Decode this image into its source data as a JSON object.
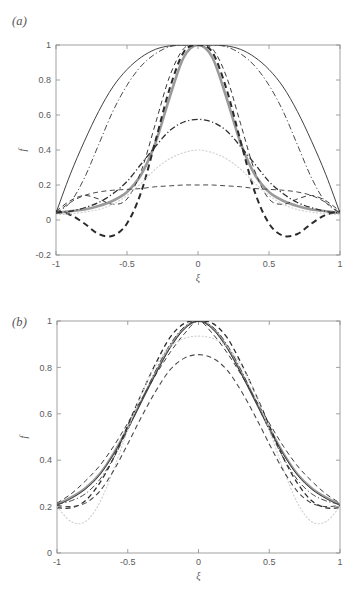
{
  "figure": {
    "panels": [
      {
        "id": "a",
        "label": "(a)",
        "xlabel": "ξ",
        "ylabel": "f",
        "xticks": [
          "-1",
          "-0.5",
          "0",
          "0.5",
          "1"
        ],
        "xtickvals": [
          -1,
          -0.5,
          0,
          0.5,
          1
        ],
        "yticks": [
          "-0.2",
          "0",
          "0.2",
          "0.4",
          "0.6",
          "0.8",
          "1"
        ],
        "ytickvals": [
          -0.2,
          0,
          0.2,
          0.4,
          0.6,
          0.8,
          1
        ],
        "xlim": [
          -1,
          1
        ],
        "ylim": [
          -0.2,
          1
        ]
      },
      {
        "id": "b",
        "label": "(b)",
        "xlabel": "ξ",
        "ylabel": "f",
        "xticks": [
          "-1",
          "-0.5",
          "0",
          "0.5",
          "1"
        ],
        "xtickvals": [
          -1,
          -0.5,
          0,
          0.5,
          1
        ],
        "yticks": [
          "0",
          "0.2",
          "0.4",
          "0.6",
          "0.8",
          "1"
        ],
        "ytickvals": [
          0,
          0.2,
          0.4,
          0.6,
          0.8,
          1
        ],
        "xlim": [
          -1,
          1
        ],
        "ylim": [
          0,
          1
        ]
      }
    ]
  },
  "colors": {
    "axis": "#8a8a8a",
    "tick_text": "#5a5a5a",
    "black": "#2b2b2b",
    "dark": "#3a3a3a",
    "gray_thick": "#9a9a9a",
    "light_dotted": "#cfcfcf",
    "mid_gray": "#6f6f6f",
    "background": "#ffffff"
  },
  "chart_data": [
    {
      "type": "line",
      "panel": "a",
      "title": "",
      "xlabel": "ξ",
      "ylabel": "f",
      "xlim": [
        -1,
        1
      ],
      "ylim": [
        -0.2,
        1
      ],
      "grid": false,
      "legend": "none",
      "x": [
        -1,
        -0.9,
        -0.8,
        -0.7,
        -0.6,
        -0.5,
        -0.4,
        -0.3,
        -0.2,
        -0.1,
        0,
        0.1,
        0.2,
        0.3,
        0.4,
        0.5,
        0.6,
        0.7,
        0.8,
        0.9,
        1
      ],
      "series": [
        {
          "name": "thin-solid-parabola",
          "style": "solid",
          "width": 0.9,
          "color": "#2b2b2b",
          "values": [
            0.04,
            0.26,
            0.45,
            0.62,
            0.76,
            0.86,
            0.93,
            0.975,
            0.995,
            1.0,
            1.0,
            1.0,
            0.995,
            0.975,
            0.93,
            0.86,
            0.76,
            0.62,
            0.45,
            0.26,
            0.04
          ]
        },
        {
          "name": "thick-gray-solid",
          "style": "solid",
          "width": 2.6,
          "color": "#9a9a9a",
          "values": [
            0.04,
            0.05,
            0.06,
            0.08,
            0.11,
            0.16,
            0.26,
            0.44,
            0.7,
            0.93,
            1.0,
            0.93,
            0.7,
            0.44,
            0.26,
            0.16,
            0.11,
            0.08,
            0.06,
            0.05,
            0.04
          ]
        },
        {
          "name": "heavy-black-dashed",
          "style": "dashed",
          "width": 2.0,
          "color": "#2b2b2b",
          "values": [
            0.05,
            0.03,
            -0.02,
            -0.08,
            -0.09,
            -0.02,
            0.16,
            0.45,
            0.75,
            0.96,
            1.0,
            0.96,
            0.75,
            0.45,
            0.16,
            -0.02,
            -0.09,
            -0.08,
            -0.02,
            0.03,
            0.05
          ]
        },
        {
          "name": "dash-dot-wide",
          "style": "dashdot",
          "width": 1.0,
          "color": "#4a4a4a",
          "values": [
            0.04,
            0.1,
            0.24,
            0.43,
            0.62,
            0.77,
            0.88,
            0.95,
            0.99,
            1.0,
            1.0,
            1.0,
            0.99,
            0.95,
            0.88,
            0.77,
            0.62,
            0.43,
            0.24,
            0.1,
            0.04
          ]
        },
        {
          "name": "thin-dashed-narrow",
          "style": "dashed",
          "width": 1.0,
          "color": "#3a3a3a",
          "values": [
            0.05,
            0.11,
            0.14,
            0.12,
            0.09,
            0.12,
            0.28,
            0.55,
            0.82,
            0.98,
            1.0,
            0.98,
            0.82,
            0.55,
            0.28,
            0.12,
            0.09,
            0.12,
            0.14,
            0.11,
            0.05
          ]
        },
        {
          "name": "dash-dot-mid-peak",
          "style": "dashdot",
          "width": 1.3,
          "color": "#2f2f2f",
          "values": [
            0.04,
            0.05,
            0.07,
            0.1,
            0.15,
            0.22,
            0.32,
            0.42,
            0.51,
            0.56,
            0.575,
            0.56,
            0.51,
            0.42,
            0.32,
            0.22,
            0.15,
            0.1,
            0.07,
            0.05,
            0.04
          ]
        },
        {
          "name": "light-dotted-low",
          "style": "dotted",
          "width": 1.1,
          "color": "#cfcfcf",
          "values": [
            0.03,
            0.035,
            0.045,
            0.06,
            0.09,
            0.14,
            0.21,
            0.29,
            0.35,
            0.385,
            0.4,
            0.385,
            0.35,
            0.29,
            0.21,
            0.14,
            0.09,
            0.06,
            0.045,
            0.035,
            0.03
          ]
        },
        {
          "name": "flat-dashed-lowest",
          "style": "dashed",
          "width": 1.0,
          "color": "#4a4a4a",
          "values": [
            0.04,
            0.1,
            0.14,
            0.16,
            0.17,
            0.175,
            0.18,
            0.19,
            0.195,
            0.2,
            0.2,
            0.2,
            0.195,
            0.19,
            0.18,
            0.175,
            0.17,
            0.16,
            0.14,
            0.1,
            0.04
          ]
        }
      ]
    },
    {
      "type": "line",
      "panel": "b",
      "title": "",
      "xlabel": "ξ",
      "ylabel": "f",
      "xlim": [
        -1,
        1
      ],
      "ylim": [
        0,
        1
      ],
      "grid": false,
      "legend": "none",
      "x": [
        -1,
        -0.9,
        -0.8,
        -0.7,
        -0.6,
        -0.5,
        -0.4,
        -0.3,
        -0.2,
        -0.1,
        0,
        0.1,
        0.2,
        0.3,
        0.4,
        0.5,
        0.6,
        0.7,
        0.8,
        0.9,
        1
      ],
      "series": [
        {
          "name": "gray-thick-solid",
          "style": "solid",
          "width": 2.2,
          "color": "#9a9a9a",
          "values": [
            0.21,
            0.24,
            0.28,
            0.34,
            0.43,
            0.54,
            0.66,
            0.78,
            0.89,
            0.97,
            1.0,
            0.97,
            0.89,
            0.78,
            0.66,
            0.54,
            0.43,
            0.34,
            0.28,
            0.24,
            0.21
          ]
        },
        {
          "name": "black-solid-thin",
          "style": "solid",
          "width": 0.9,
          "color": "#2b2b2b",
          "values": [
            0.205,
            0.235,
            0.275,
            0.335,
            0.425,
            0.535,
            0.655,
            0.775,
            0.885,
            0.965,
            1.0,
            0.965,
            0.885,
            0.775,
            0.655,
            0.535,
            0.425,
            0.335,
            0.275,
            0.235,
            0.205
          ]
        },
        {
          "name": "black-dashed-steep",
          "style": "dashed",
          "width": 1.3,
          "color": "#2b2b2b",
          "values": [
            0.195,
            0.195,
            0.225,
            0.3,
            0.41,
            0.55,
            0.69,
            0.82,
            0.93,
            0.99,
            1.0,
            0.99,
            0.93,
            0.82,
            0.69,
            0.55,
            0.41,
            0.3,
            0.225,
            0.195,
            0.195
          ]
        },
        {
          "name": "dash-dot-b",
          "style": "dashdot",
          "width": 1.0,
          "color": "#4a4a4a",
          "values": [
            0.21,
            0.225,
            0.255,
            0.315,
            0.41,
            0.53,
            0.66,
            0.79,
            0.9,
            0.975,
            1.0,
            0.975,
            0.9,
            0.79,
            0.66,
            0.53,
            0.41,
            0.315,
            0.255,
            0.225,
            0.21
          ]
        },
        {
          "name": "dashed-rounded",
          "style": "dashed",
          "width": 1.0,
          "color": "#3a3a3a",
          "values": [
            0.215,
            0.255,
            0.31,
            0.375,
            0.46,
            0.56,
            0.665,
            0.77,
            0.865,
            0.945,
            1.0,
            0.945,
            0.865,
            0.77,
            0.665,
            0.56,
            0.46,
            0.375,
            0.31,
            0.255,
            0.215
          ]
        },
        {
          "name": "light-dotted-b",
          "style": "dotted",
          "width": 1.1,
          "color": "#cfcfcf",
          "values": [
            0.2,
            0.135,
            0.135,
            0.215,
            0.36,
            0.53,
            0.69,
            0.81,
            0.89,
            0.925,
            0.935,
            0.925,
            0.89,
            0.81,
            0.69,
            0.53,
            0.36,
            0.215,
            0.135,
            0.135,
            0.2
          ]
        },
        {
          "name": "flat-dashed-b",
          "style": "dashed",
          "width": 1.1,
          "color": "#4a4a4a",
          "values": [
            0.205,
            0.2,
            0.215,
            0.265,
            0.355,
            0.47,
            0.59,
            0.7,
            0.79,
            0.84,
            0.855,
            0.84,
            0.79,
            0.7,
            0.59,
            0.47,
            0.355,
            0.265,
            0.215,
            0.2,
            0.205
          ]
        }
      ]
    }
  ]
}
